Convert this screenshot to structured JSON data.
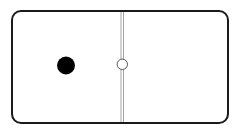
{
  "domino": {
    "left_value": 1,
    "right_value": 0,
    "colors": {
      "face": "#ffffff",
      "border": "#1a1a1a",
      "pip": "#000000",
      "divider": "#9a9a9a"
    }
  }
}
